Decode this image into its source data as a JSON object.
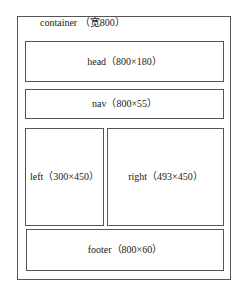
{
  "diagram": {
    "type": "page-layout-wireframe",
    "container": {
      "label": "container （宽800）",
      "name": "container",
      "width": 800
    },
    "blocks": [
      {
        "id": "head",
        "label": "head（800×180）",
        "width": 800,
        "height": 180
      },
      {
        "id": "nav",
        "label": "nav（800×55）",
        "width": 800,
        "height": 55
      },
      {
        "id": "left",
        "label": "left（300×450）",
        "width": 300,
        "height": 450
      },
      {
        "id": "right",
        "label": "right（493×450）",
        "width": 493,
        "height": 450
      },
      {
        "id": "footer",
        "label": "footer（800×60）",
        "width": 800,
        "height": 60
      }
    ],
    "colors": {
      "border": "#555555",
      "background": "#ffffff",
      "text": "#222222"
    }
  }
}
